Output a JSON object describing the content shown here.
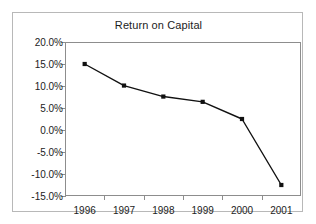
{
  "chart_data": {
    "type": "line",
    "title": "Return on Capital",
    "xlabel": "",
    "ylabel": "",
    "categories": [
      "1996",
      "1997",
      "1998",
      "1999",
      "2000",
      "2001"
    ],
    "values": [
      15.0,
      10.1,
      7.6,
      6.4,
      2.5,
      -12.5
    ],
    "series": [
      {
        "name": "Return on Capital",
        "values": [
          15.0,
          10.1,
          7.6,
          6.4,
          2.5,
          -12.5
        ]
      }
    ],
    "ylim": [
      -15.0,
      20.0
    ],
    "ytick_values": [
      20.0,
      15.0,
      10.0,
      5.0,
      0.0,
      -5.0,
      -10.0,
      -15.0
    ],
    "ytick_labels": [
      "20.0%",
      "15.0%",
      "10.0%",
      "5.0%",
      "0.0%",
      "-5.0%",
      "-10.0%",
      "-15.0%"
    ],
    "grid": false,
    "legend": false,
    "legend_position": "none",
    "line_color": "#111111",
    "marker": "square",
    "marker_color": "#111111",
    "axis_color": "#8d8d8d",
    "frame_color": "#b8b8b8",
    "background": "#ffffff"
  }
}
